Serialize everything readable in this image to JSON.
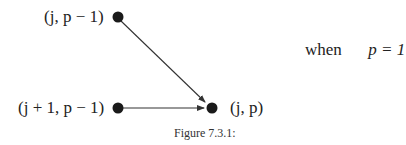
{
  "diagram": {
    "nodes": [
      {
        "id": "top",
        "label": "(j, p − 1)",
        "x": 118,
        "y": 17
      },
      {
        "id": "bottom-left",
        "label": "(j + 1, p − 1)",
        "x": 118,
        "y": 108
      },
      {
        "id": "target",
        "label": "(j, p)",
        "x": 212,
        "y": 108
      }
    ],
    "edges": [
      {
        "from": "top",
        "to": "target"
      },
      {
        "from": "bottom-left",
        "to": "target"
      }
    ],
    "condition": {
      "word": "when",
      "expression": "p = 1"
    },
    "caption": "Figure 7.3.1:",
    "colors": {
      "node": "#1a1a1a",
      "edge": "#333333"
    }
  }
}
